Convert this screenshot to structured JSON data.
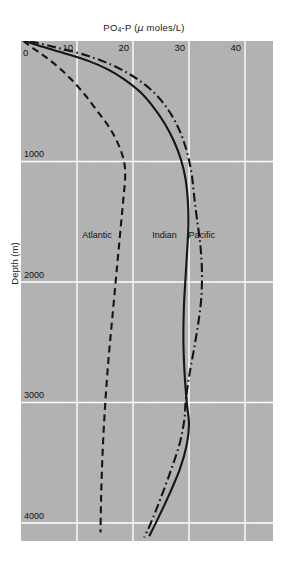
{
  "chart_data": {
    "type": "line",
    "title_parts": {
      "lead": "PO",
      "sub": "4",
      "mid": "-P (",
      "mu": "μ",
      "tail": " moles/L)"
    },
    "xlabel": "PO4-P (μ moles/L)",
    "ylabel": "Depth (m)",
    "xlim": [
      0,
      45
    ],
    "ylim": [
      0,
      4150
    ],
    "y_inverted": true,
    "grid": "white gridlines at x ticks and y ticks",
    "legend_position": "inline annotations next to curves",
    "xticks": [
      0,
      10,
      20,
      30,
      40
    ],
    "xtick_labels": [
      "0",
      "10",
      "20",
      "30",
      "40"
    ],
    "yticks": [
      0,
      1000,
      2000,
      3000,
      4000
    ],
    "ytick_labels": [
      "0",
      "1000",
      "2000",
      "3000",
      "4000"
    ],
    "annotations": [
      {
        "text": "Atlantic",
        "x": 14.5,
        "y": 1620
      },
      {
        "text": "Indian",
        "x": 27.0,
        "y": 1620
      },
      {
        "text": "Pacific",
        "x": 33.5,
        "y": 1620
      }
    ],
    "series": [
      {
        "name": "Atlantic",
        "style": "dashed",
        "color": "#111111",
        "points": [
          [
            0.4,
            0
          ],
          [
            2.0,
            55
          ],
          [
            4.3,
            130
          ],
          [
            6.6,
            215
          ],
          [
            9.0,
            320
          ],
          [
            11.3,
            440
          ],
          [
            13.6,
            580
          ],
          [
            15.8,
            720
          ],
          [
            17.4,
            860
          ],
          [
            18.4,
            1000
          ],
          [
            18.6,
            1130
          ],
          [
            18.3,
            1300
          ],
          [
            17.9,
            1500
          ],
          [
            17.4,
            1750
          ],
          [
            16.9,
            2000
          ],
          [
            16.3,
            2300
          ],
          [
            15.7,
            2600
          ],
          [
            15.2,
            2900
          ],
          [
            14.8,
            3200
          ],
          [
            14.5,
            3500
          ],
          [
            14.3,
            3800
          ],
          [
            14.2,
            4080
          ]
        ]
      },
      {
        "name": "Indian",
        "style": "solid",
        "color": "#111111",
        "points": [
          [
            0.6,
            0
          ],
          [
            4.0,
            50
          ],
          [
            8.0,
            105
          ],
          [
            12.0,
            165
          ],
          [
            15.5,
            235
          ],
          [
            18.5,
            320
          ],
          [
            21.2,
            420
          ],
          [
            23.5,
            540
          ],
          [
            25.6,
            680
          ],
          [
            27.3,
            830
          ],
          [
            28.6,
            990
          ],
          [
            29.4,
            1150
          ],
          [
            29.8,
            1330
          ],
          [
            29.9,
            1520
          ],
          [
            29.7,
            1720
          ],
          [
            29.4,
            1950
          ],
          [
            29.1,
            2200
          ],
          [
            29.0,
            2480
          ],
          [
            29.2,
            2750
          ],
          [
            29.6,
            3000
          ],
          [
            30.0,
            3180
          ],
          [
            29.6,
            3350
          ],
          [
            28.4,
            3550
          ],
          [
            26.6,
            3750
          ],
          [
            24.6,
            3950
          ],
          [
            22.9,
            4110
          ]
        ]
      },
      {
        "name": "Pacific",
        "style": "dashdot",
        "color": "#111111",
        "points": [
          [
            1.6,
            0
          ],
          [
            5.5,
            45
          ],
          [
            9.5,
            90
          ],
          [
            13.0,
            140
          ],
          [
            16.3,
            200
          ],
          [
            19.2,
            270
          ],
          [
            21.8,
            350
          ],
          [
            24.0,
            440
          ],
          [
            25.9,
            545
          ],
          [
            27.5,
            665
          ],
          [
            28.8,
            800
          ],
          [
            29.8,
            950
          ],
          [
            30.5,
            1110
          ],
          [
            30.9,
            1280
          ],
          [
            31.4,
            1470
          ],
          [
            32.0,
            1680
          ],
          [
            32.3,
            1900
          ],
          [
            32.2,
            2130
          ],
          [
            31.6,
            2360
          ],
          [
            30.8,
            2580
          ],
          [
            30.0,
            2790
          ],
          [
            29.4,
            2990
          ],
          [
            29.2,
            3130
          ],
          [
            28.4,
            3330
          ],
          [
            26.8,
            3560
          ],
          [
            24.9,
            3800
          ],
          [
            23.2,
            4000
          ],
          [
            22.0,
            4120
          ]
        ]
      }
    ]
  },
  "figure": {
    "background_color": "#ffffff",
    "panel_color": "#b2b2b2",
    "gridline_color": "#ffffff",
    "line_color": "#111111"
  }
}
